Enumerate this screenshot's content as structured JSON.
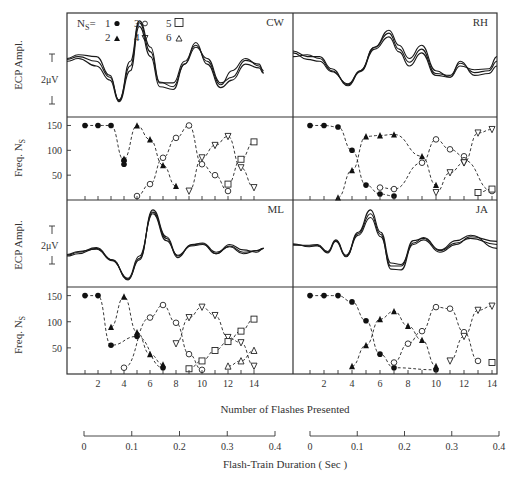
{
  "labels": {
    "ecp_axis": "ECP Ampl.",
    "freq_axis": "Freq. N",
    "freq_axis_sub": "S",
    "scale_bar": "2μV",
    "x_axis_title": "Number of Flashes  Presented",
    "duration_axis_title": "Flash-Train  Duration ( Sec )",
    "legend_prefix": "N",
    "legend_prefix_sub": "S",
    "legend_eq": "= "
  },
  "legend": [
    {
      "n": "1",
      "symbol": "filled-circle"
    },
    {
      "n": "2",
      "symbol": "filled-triangle-up"
    },
    {
      "n": "3",
      "symbol": "open-circle"
    },
    {
      "n": "4",
      "symbol": "open-triangle-down"
    },
    {
      "n": "5",
      "symbol": "open-square"
    },
    {
      "n": "6",
      "symbol": "open-triangle-up"
    }
  ],
  "freq_ticks": [
    "150",
    "100",
    "50"
  ],
  "x_tick_labels": [
    "2",
    "4",
    "6",
    "8",
    "10",
    "12",
    "14"
  ],
  "duration_tick_labels": [
    "0",
    "0.1",
    "0.2",
    "0.3",
    "0.4"
  ],
  "chart_data": [
    {
      "type": "scatter",
      "title": "CW",
      "xlabel": "Number of Flashes Presented",
      "ylabel": "Freq. Ns",
      "ylim": [
        0,
        160
      ],
      "xlim": [
        0,
        14.5
      ],
      "series": [
        {
          "name": "Ns=1",
          "symbol": "filled-circle",
          "x": [
            1,
            2,
            3,
            4,
            4
          ],
          "y": [
            150,
            150,
            150,
            80,
            72
          ]
        },
        {
          "name": "Ns=2",
          "symbol": "filled-triangle-up",
          "x": [
            4,
            5,
            6,
            7,
            8
          ],
          "y": [
            83,
            150,
            122,
            70,
            28
          ]
        },
        {
          "name": "Ns=3",
          "symbol": "open-circle",
          "x": [
            5,
            6,
            7,
            8,
            9,
            10,
            11,
            12
          ],
          "y": [
            8,
            32,
            85,
            125,
            150,
            72,
            50,
            18
          ]
        },
        {
          "name": "Ns=4",
          "symbol": "open-triangle-down",
          "x": [
            9,
            10,
            11,
            12,
            13,
            14
          ],
          "y": [
            18,
            85,
            110,
            128,
            65,
            25
          ]
        },
        {
          "name": "Ns=5",
          "symbol": "open-square",
          "x": [
            12,
            13,
            14
          ],
          "y": [
            32,
            82,
            117
          ]
        }
      ],
      "waves_top": "CW evoked potential traces"
    },
    {
      "type": "scatter",
      "title": "RH",
      "xlabel": "Number of Flashes Presented",
      "ylabel": "Freq. Ns",
      "ylim": [
        0,
        160
      ],
      "xlim": [
        0,
        14.5
      ],
      "series": [
        {
          "name": "Ns=1",
          "symbol": "filled-circle",
          "x": [
            1,
            2,
            3,
            4,
            5,
            6,
            7
          ],
          "y": [
            150,
            150,
            147,
            100,
            30,
            12,
            8
          ]
        },
        {
          "name": "Ns=2",
          "symbol": "filled-triangle-up",
          "x": [
            3,
            4,
            5,
            6,
            7,
            9,
            10
          ],
          "y": [
            5,
            60,
            128,
            130,
            132,
            88,
            30
          ]
        },
        {
          "name": "Ns=3",
          "symbol": "open-circle",
          "x": [
            6,
            7,
            9,
            10,
            11,
            12,
            12,
            14
          ],
          "y": [
            25,
            22,
            75,
            122,
            102,
            88,
            80,
            18
          ]
        },
        {
          "name": "Ns=4",
          "symbol": "open-triangle-down",
          "x": [
            10,
            11,
            12,
            12,
            13,
            14
          ],
          "y": [
            15,
            55,
            75,
            75,
            135,
            142
          ]
        },
        {
          "name": "Ns=5",
          "symbol": "open-square",
          "x": [
            13,
            14
          ],
          "y": [
            15,
            22
          ]
        }
      ]
    },
    {
      "type": "scatter",
      "title": "ML",
      "xlabel": "Number of Flashes Presented",
      "ylabel": "Freq. Ns",
      "ylim": [
        0,
        160
      ],
      "xlim": [
        0,
        14.5
      ],
      "series": [
        {
          "name": "Ns=1",
          "symbol": "filled-circle",
          "x": [
            1,
            2,
            3,
            5,
            7
          ],
          "y": [
            150,
            150,
            55,
            72,
            12
          ]
        },
        {
          "name": "Ns=2",
          "symbol": "filled-triangle-up",
          "x": [
            3,
            4,
            5,
            6,
            7
          ],
          "y": [
            90,
            148,
            80,
            38,
            18
          ]
        },
        {
          "name": "Ns=3",
          "symbol": "open-circle",
          "x": [
            4,
            6,
            7,
            8,
            9,
            10
          ],
          "y": [
            12,
            108,
            132,
            98,
            38,
            8
          ]
        },
        {
          "name": "Ns=4",
          "symbol": "open-triangle-down",
          "x": [
            8,
            9,
            10,
            11,
            12,
            13,
            14
          ],
          "y": [
            58,
            108,
            128,
            112,
            70,
            60,
            15
          ]
        },
        {
          "name": "Ns=5",
          "symbol": "open-square",
          "x": [
            9,
            10,
            11,
            12,
            13,
            14
          ],
          "y": [
            10,
            25,
            45,
            62,
            82,
            105
          ]
        },
        {
          "name": "Ns=6",
          "symbol": "open-triangle-up",
          "x": [
            12,
            13,
            14
          ],
          "y": [
            15,
            25,
            45
          ]
        }
      ]
    },
    {
      "type": "scatter",
      "title": "JA",
      "xlabel": "Number of Flashes Presented",
      "ylabel": "Freq. Ns",
      "ylim": [
        0,
        160
      ],
      "xlim": [
        0,
        14.5
      ],
      "series": [
        {
          "name": "Ns=1",
          "symbol": "filled-circle",
          "x": [
            1,
            2,
            3,
            4,
            5,
            6,
            7,
            10
          ],
          "y": [
            150,
            150,
            150,
            138,
            102,
            38,
            12,
            8
          ]
        },
        {
          "name": "Ns=2",
          "symbol": "filled-triangle-up",
          "x": [
            4,
            5,
            6,
            7,
            8,
            9,
            10
          ],
          "y": [
            15,
            55,
            105,
            120,
            92,
            65,
            15
          ]
        },
        {
          "name": "Ns=3",
          "symbol": "open-circle",
          "x": [
            7,
            8,
            9,
            10,
            11,
            12,
            13
          ],
          "y": [
            22,
            58,
            82,
            128,
            125,
            80,
            25
          ]
        },
        {
          "name": "Ns=4",
          "symbol": "open-triangle-down",
          "x": [
            11,
            12,
            13,
            14
          ],
          "y": [
            25,
            72,
            122,
            130
          ]
        },
        {
          "name": "Ns=5",
          "symbol": "open-square",
          "x": [
            14
          ],
          "y": [
            22
          ]
        }
      ]
    }
  ],
  "waves": {
    "CW": [
      [
        [
          0,
          0.55
        ],
        [
          0.05,
          0.58
        ],
        [
          0.13,
          0.5
        ],
        [
          0.19,
          0.35
        ],
        [
          0.23,
          0.12
        ],
        [
          0.28,
          0.45
        ],
        [
          0.32,
          0.92
        ],
        [
          0.37,
          0.6
        ],
        [
          0.41,
          0.28
        ],
        [
          0.47,
          0.25
        ],
        [
          0.52,
          0.52
        ],
        [
          0.57,
          0.75
        ],
        [
          0.62,
          0.52
        ],
        [
          0.68,
          0.27
        ],
        [
          0.73,
          0.35
        ],
        [
          0.79,
          0.52
        ],
        [
          0.85,
          0.48
        ],
        [
          0.87,
          0.42
        ]
      ],
      [
        [
          0,
          0.57
        ],
        [
          0.05,
          0.6
        ],
        [
          0.13,
          0.55
        ],
        [
          0.19,
          0.38
        ],
        [
          0.23,
          0.14
        ],
        [
          0.28,
          0.5
        ],
        [
          0.32,
          0.96
        ],
        [
          0.37,
          0.65
        ],
        [
          0.41,
          0.32
        ],
        [
          0.47,
          0.32
        ],
        [
          0.52,
          0.55
        ],
        [
          0.57,
          0.72
        ],
        [
          0.62,
          0.55
        ],
        [
          0.68,
          0.3
        ],
        [
          0.73,
          0.45
        ],
        [
          0.79,
          0.58
        ],
        [
          0.85,
          0.5
        ],
        [
          0.87,
          0.45
        ]
      ],
      [
        [
          0,
          0.58
        ],
        [
          0.05,
          0.62
        ],
        [
          0.13,
          0.6
        ],
        [
          0.19,
          0.4
        ],
        [
          0.23,
          0.13
        ],
        [
          0.28,
          0.55
        ],
        [
          0.32,
          0.98
        ],
        [
          0.37,
          0.7
        ],
        [
          0.41,
          0.33
        ],
        [
          0.47,
          0.28
        ],
        [
          0.52,
          0.52
        ],
        [
          0.57,
          0.7
        ],
        [
          0.62,
          0.58
        ],
        [
          0.68,
          0.32
        ],
        [
          0.73,
          0.38
        ],
        [
          0.79,
          0.56
        ],
        [
          0.85,
          0.52
        ],
        [
          0.87,
          0.43
        ]
      ]
    ],
    "RH": [
      [
        [
          0,
          0.6
        ],
        [
          0.07,
          0.62
        ],
        [
          0.13,
          0.58
        ],
        [
          0.19,
          0.45
        ],
        [
          0.27,
          0.3
        ],
        [
          0.33,
          0.45
        ],
        [
          0.4,
          0.7
        ],
        [
          0.47,
          0.88
        ],
        [
          0.52,
          0.72
        ],
        [
          0.57,
          0.58
        ],
        [
          0.63,
          0.72
        ],
        [
          0.7,
          0.45
        ],
        [
          0.77,
          0.38
        ],
        [
          0.82,
          0.55
        ],
        [
          0.89,
          0.4
        ],
        [
          0.96,
          0.42
        ],
        [
          1,
          0.5
        ]
      ],
      [
        [
          0,
          0.64
        ],
        [
          0.07,
          0.57
        ],
        [
          0.13,
          0.55
        ],
        [
          0.19,
          0.44
        ],
        [
          0.27,
          0.31
        ],
        [
          0.33,
          0.45
        ],
        [
          0.4,
          0.7
        ],
        [
          0.47,
          0.85
        ],
        [
          0.52,
          0.68
        ],
        [
          0.57,
          0.54
        ],
        [
          0.63,
          0.68
        ],
        [
          0.7,
          0.42
        ],
        [
          0.77,
          0.4
        ],
        [
          0.82,
          0.53
        ],
        [
          0.89,
          0.43
        ],
        [
          0.96,
          0.45
        ],
        [
          1,
          0.55
        ]
      ],
      [
        [
          0,
          0.66
        ],
        [
          0.07,
          0.6
        ],
        [
          0.13,
          0.6
        ],
        [
          0.19,
          0.47
        ],
        [
          0.27,
          0.29
        ],
        [
          0.33,
          0.44
        ],
        [
          0.4,
          0.68
        ],
        [
          0.47,
          0.81
        ],
        [
          0.52,
          0.65
        ],
        [
          0.57,
          0.5
        ],
        [
          0.63,
          0.64
        ],
        [
          0.7,
          0.4
        ],
        [
          0.77,
          0.38
        ],
        [
          0.82,
          0.5
        ],
        [
          0.89,
          0.46
        ],
        [
          0.96,
          0.47
        ],
        [
          1,
          0.6
        ]
      ]
    ],
    "ML": [
      [
        [
          0,
          0.35
        ],
        [
          0.05,
          0.38
        ],
        [
          0.13,
          0.45
        ],
        [
          0.2,
          0.3
        ],
        [
          0.27,
          0.05
        ],
        [
          0.32,
          0.3
        ],
        [
          0.38,
          0.95
        ],
        [
          0.44,
          0.6
        ],
        [
          0.49,
          0.35
        ],
        [
          0.55,
          0.48
        ],
        [
          0.6,
          0.5
        ],
        [
          0.66,
          0.38
        ],
        [
          0.72,
          0.48
        ],
        [
          0.78,
          0.4
        ],
        [
          0.84,
          0.42
        ],
        [
          0.87,
          0.45
        ]
      ],
      [
        [
          0,
          0.36
        ],
        [
          0.05,
          0.4
        ],
        [
          0.13,
          0.46
        ],
        [
          0.2,
          0.3
        ],
        [
          0.27,
          0.04
        ],
        [
          0.32,
          0.32
        ],
        [
          0.38,
          0.92
        ],
        [
          0.44,
          0.58
        ],
        [
          0.49,
          0.33
        ],
        [
          0.55,
          0.5
        ],
        [
          0.6,
          0.51
        ],
        [
          0.66,
          0.38
        ],
        [
          0.72,
          0.5
        ],
        [
          0.78,
          0.43
        ],
        [
          0.84,
          0.4
        ],
        [
          0.87,
          0.45
        ]
      ],
      [
        [
          0,
          0.37
        ],
        [
          0.05,
          0.41
        ],
        [
          0.13,
          0.44
        ],
        [
          0.2,
          0.29
        ],
        [
          0.27,
          0.06
        ],
        [
          0.32,
          0.35
        ],
        [
          0.38,
          0.9
        ],
        [
          0.44,
          0.55
        ],
        [
          0.49,
          0.36
        ],
        [
          0.55,
          0.49
        ],
        [
          0.6,
          0.52
        ],
        [
          0.66,
          0.4
        ],
        [
          0.72,
          0.47
        ],
        [
          0.78,
          0.38
        ],
        [
          0.84,
          0.42
        ],
        [
          0.87,
          0.45
        ]
      ]
    ],
    "JA": [
      [
        [
          0,
          0.5
        ],
        [
          0.08,
          0.48
        ],
        [
          0.12,
          0.48
        ],
        [
          0.17,
          0.4
        ],
        [
          0.21,
          0.55
        ],
        [
          0.26,
          0.35
        ],
        [
          0.32,
          0.62
        ],
        [
          0.38,
          0.85
        ],
        [
          0.43,
          0.6
        ],
        [
          0.48,
          0.22
        ],
        [
          0.53,
          0.22
        ],
        [
          0.59,
          0.55
        ],
        [
          0.64,
          0.58
        ],
        [
          0.72,
          0.42
        ],
        [
          0.8,
          0.52
        ],
        [
          0.87,
          0.58
        ],
        [
          1,
          0.5
        ]
      ],
      [
        [
          0,
          0.49
        ],
        [
          0.08,
          0.49
        ],
        [
          0.12,
          0.5
        ],
        [
          0.17,
          0.41
        ],
        [
          0.21,
          0.56
        ],
        [
          0.26,
          0.36
        ],
        [
          0.32,
          0.64
        ],
        [
          0.38,
          0.9
        ],
        [
          0.43,
          0.63
        ],
        [
          0.48,
          0.18
        ],
        [
          0.53,
          0.17
        ],
        [
          0.59,
          0.52
        ],
        [
          0.64,
          0.59
        ],
        [
          0.72,
          0.43
        ],
        [
          0.8,
          0.55
        ],
        [
          0.87,
          0.62
        ],
        [
          1,
          0.45
        ]
      ],
      [
        [
          0,
          0.51
        ],
        [
          0.08,
          0.47
        ],
        [
          0.12,
          0.49
        ],
        [
          0.17,
          0.39
        ],
        [
          0.21,
          0.54
        ],
        [
          0.26,
          0.34
        ],
        [
          0.32,
          0.66
        ],
        [
          0.38,
          0.95
        ],
        [
          0.43,
          0.66
        ],
        [
          0.48,
          0.26
        ],
        [
          0.53,
          0.24
        ],
        [
          0.59,
          0.5
        ],
        [
          0.64,
          0.56
        ],
        [
          0.72,
          0.4
        ],
        [
          0.8,
          0.5
        ],
        [
          0.87,
          0.6
        ],
        [
          1,
          0.54
        ]
      ]
    ]
  }
}
